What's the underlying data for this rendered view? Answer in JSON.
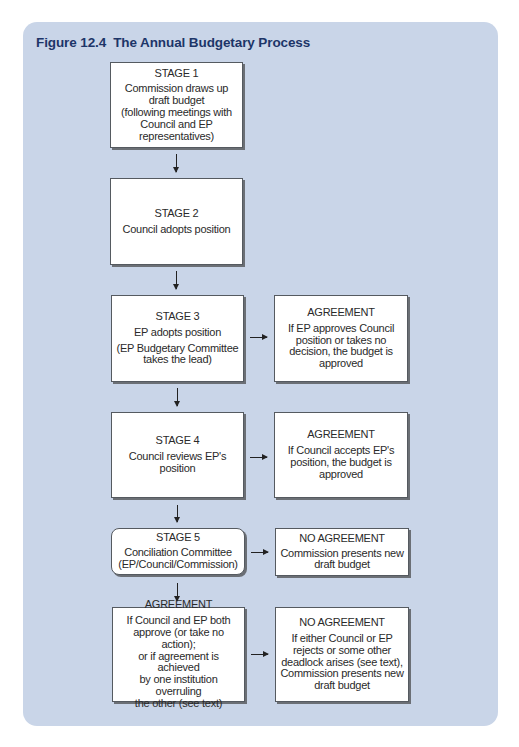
{
  "figure": {
    "number": "Figure 12.4",
    "title": "The Annual Budgetary Process"
  },
  "colors": {
    "panel_bg": "#c9d5e8",
    "title": "#1d3568",
    "box_bg": "#ffffff",
    "box_border": "#555a60"
  },
  "stages": [
    {
      "label": "STAGE 1",
      "lines": [
        "Commission draws up",
        "draft budget",
        "(following meetings with",
        "Council and EP",
        "representatives)"
      ]
    },
    {
      "label": "STAGE 2",
      "lines": [
        "Council adopts position"
      ]
    },
    {
      "label": "STAGE 3",
      "lines": [
        "EP adopts position"
      ],
      "sub": [
        "(EP Budgetary Committee",
        "takes the lead)"
      ]
    },
    {
      "label": "STAGE 4",
      "lines": [
        "Council reviews EP's",
        "position"
      ]
    },
    {
      "label": "STAGE 5",
      "lines": [
        "Conciliation Committee",
        "(EP/Council/Commission)"
      ]
    },
    {
      "label": "AGREEMENT",
      "lines": [
        "If Council and EP both",
        "approve (or take no action);",
        "or if agreement is achieved",
        "by one institution overruling",
        "the other (see text)"
      ]
    }
  ],
  "outcomes": [
    {
      "label": "AGREEMENT",
      "lines": [
        "If EP approves Council",
        "position or takes no",
        "decision, the budget is",
        "approved"
      ]
    },
    {
      "label": "AGREEMENT",
      "lines": [
        "If Council accepts EP's",
        "position, the budget is",
        "approved"
      ]
    },
    {
      "label": "NO AGREEMENT",
      "lines": [
        "Commission presents new",
        "draft budget"
      ]
    },
    {
      "label": "NO AGREEMENT",
      "lines": [
        "If either Council or EP",
        "rejects or some other",
        "deadlock arises (see text),",
        "Commission presents new",
        "draft budget"
      ]
    }
  ]
}
